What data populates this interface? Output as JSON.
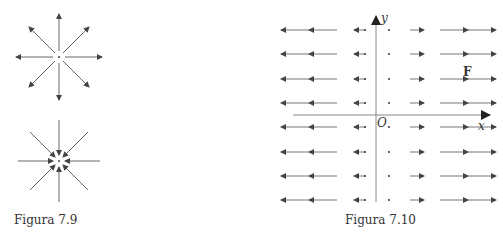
{
  "figures": [
    {
      "caption": "Figura 7.9",
      "description": "Two radial field diagrams: outward-pointing source (top) and inward-pointing sink (bottom)"
    },
    {
      "caption": "Figura 7.10",
      "description": "Vector field F in the plane; horizontal arrows whose length grows with |x|, pointing left for x<0 and right for x>0",
      "axis_x_label": "x",
      "axis_y_label": "y",
      "origin_label": "O",
      "field_label": "F"
    }
  ],
  "colors": {
    "stroke": "#555555",
    "axis": "#888888",
    "text": "#333333"
  }
}
